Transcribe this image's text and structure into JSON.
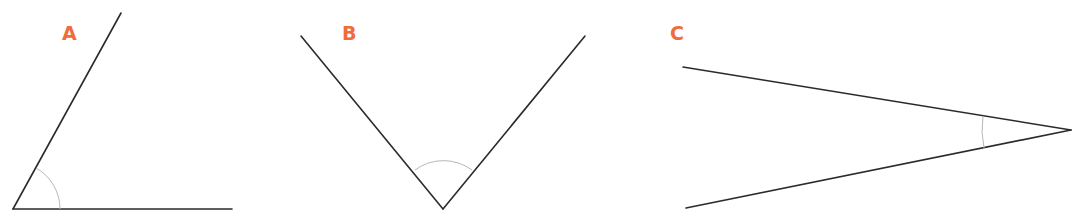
{
  "diagram": {
    "label_color": "#f26b3a",
    "line_color": "#2b2b2b",
    "arc_color": "#b8b8b8",
    "angles": [
      {
        "id": "A",
        "label": "A",
        "type": "acute",
        "approx_degrees": 61
      },
      {
        "id": "B",
        "label": "B",
        "type": "right",
        "approx_degrees": 90
      },
      {
        "id": "C",
        "label": "C",
        "type": "acute",
        "approx_degrees": 20
      }
    ]
  }
}
